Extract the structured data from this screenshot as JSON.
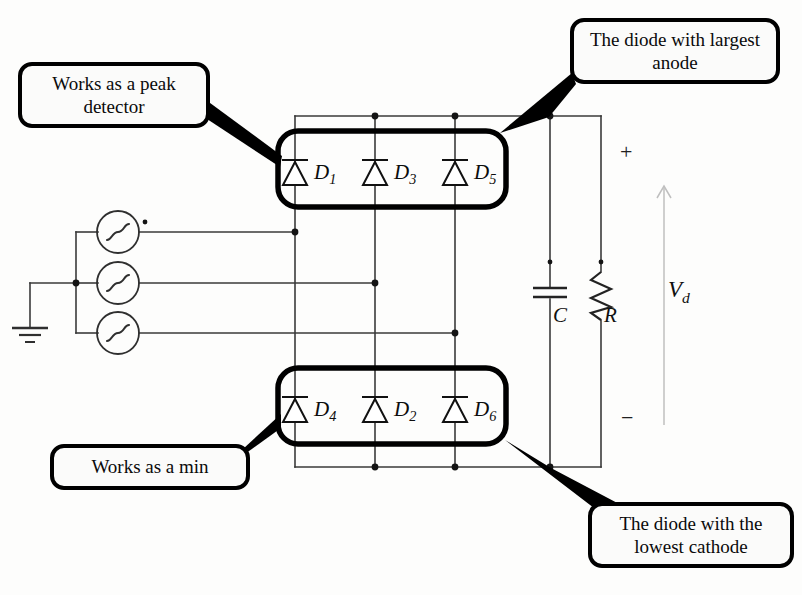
{
  "diagram": {
    "type": "circuit-schematic"
  },
  "callouts": [
    {
      "id": "peak-detector",
      "text": "Works as a peak detector",
      "position": "top-left"
    },
    {
      "id": "largest-anode",
      "text": "The diode with largest anode",
      "position": "top-right"
    },
    {
      "id": "works-min",
      "text": "Works as a min",
      "position": "bottom-left"
    },
    {
      "id": "lowest-cathode",
      "text": "The diode with the lowest cathode",
      "position": "bottom-right"
    }
  ],
  "diodes": {
    "top_group": [
      {
        "name": "D",
        "index": "1"
      },
      {
        "name": "D",
        "index": "3"
      },
      {
        "name": "D",
        "index": "5"
      }
    ],
    "bottom_group": [
      {
        "name": "D",
        "index": "4"
      },
      {
        "name": "D",
        "index": "2"
      },
      {
        "name": "D",
        "index": "6"
      }
    ]
  },
  "components": {
    "capacitor_label": "C",
    "resistor_label": "R",
    "output_voltage_label": "V",
    "output_voltage_sub": "d",
    "polarity_plus": "+",
    "polarity_minus": "−"
  },
  "sources": {
    "count": 3,
    "symbol": "ac-source-sine",
    "neutral": "ground"
  },
  "colors": {
    "wire": "#3a3a3a",
    "callout_border": "#000000",
    "callout_fill": "#fbfbfa",
    "arrow": "#b9b9b9",
    "background": "#fdfdfc"
  }
}
